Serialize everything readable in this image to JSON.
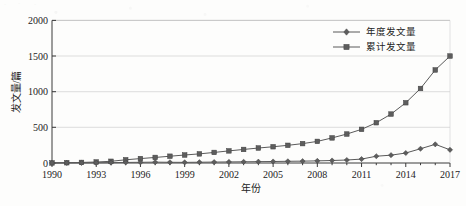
{
  "chart_data": {
    "type": "line",
    "title": "",
    "xlabel": "年份",
    "ylabel": "发文量/篇",
    "xlim": [
      1990,
      2017
    ],
    "ylim": [
      0,
      2000
    ],
    "grid": true,
    "legend_position": "top-right",
    "x": [
      1990,
      1991,
      1992,
      1993,
      1994,
      1995,
      1996,
      1997,
      1998,
      1999,
      2000,
      2001,
      2002,
      2003,
      2004,
      2005,
      2006,
      2007,
      2008,
      2009,
      2010,
      2011,
      2012,
      2013,
      2014,
      2015,
      2016,
      2017
    ],
    "xticks": [
      "1990",
      "1993",
      "1996",
      "1999",
      "2002",
      "2005",
      "2008",
      "2011",
      "2014",
      "2017"
    ],
    "yticks": [
      "0",
      "500",
      "1000",
      "1500",
      "2000"
    ],
    "series": [
      {
        "name": "年度发文量",
        "marker": "diamond",
        "color": "#595959",
        "values": [
          1,
          2,
          2,
          3,
          5,
          8,
          10,
          12,
          10,
          9,
          11,
          13,
          15,
          17,
          19,
          21,
          24,
          26,
          30,
          35,
          42,
          55,
          95,
          110,
          140,
          200,
          262,
          185
        ]
      },
      {
        "name": "累计发文量",
        "marker": "square",
        "color": "#5a5a5a",
        "values": [
          1,
          4,
          8,
          14,
          24,
          45,
          62,
          78,
          95,
          112,
          128,
          148,
          170,
          190,
          210,
          228,
          248,
          272,
          303,
          352,
          406,
          472,
          565,
          686,
          845,
          1045,
          1305,
          1500
        ]
      }
    ]
  },
  "legend": {
    "items": [
      {
        "label": "年度发文量",
        "marker": "diamond-marker-icon"
      },
      {
        "label": "累计发文量",
        "marker": "square-marker-icon"
      }
    ]
  },
  "axes": {
    "y_title": "发文量/篇",
    "x_title": "年份",
    "y_tick_labels": [
      "2000",
      "1500",
      "1000",
      "500",
      "0"
    ],
    "x_tick_labels": [
      "1990",
      "1993",
      "1996",
      "1999",
      "2002",
      "2005",
      "2008",
      "2011",
      "2014",
      "2017"
    ]
  }
}
